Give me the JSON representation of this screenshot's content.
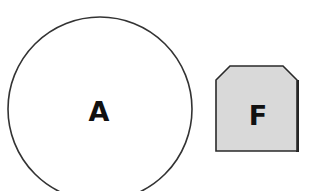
{
  "diagram": {
    "nodes": [
      {
        "id": "node-a",
        "label": "A",
        "shape": "circle",
        "fill": "#ffffff",
        "stroke": "#333333"
      },
      {
        "id": "node-f",
        "label": "F",
        "shape": "octagon-top-chamfer",
        "fill": "#d9d9d9",
        "stroke": "#222222"
      }
    ]
  }
}
